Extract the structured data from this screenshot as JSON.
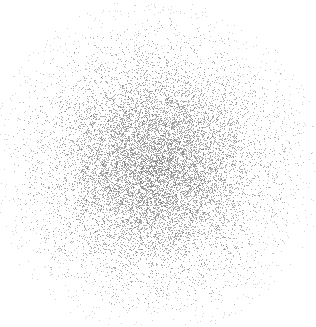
{
  "figure": {
    "width": 316,
    "height": 327,
    "background_color": "#ffffff",
    "title": "",
    "has_axes": false,
    "has_gridlines": false,
    "has_legend": false,
    "has_tick_labels": false,
    "has_frame": false
  },
  "chart_data": {
    "type": "scatter",
    "title": "",
    "xlabel": "",
    "ylabel": "",
    "grid": false,
    "legend_position": "none",
    "xlim": [
      0,
      316
    ],
    "ylim": [
      0,
      327
    ],
    "marker": {
      "shape": "square-pixel",
      "size_px": 1,
      "color": "#6e6e6e",
      "opacity": 0.55,
      "edge_color": "none"
    },
    "series": [
      {
        "name": "gaussian-cloud",
        "distribution": "bivariate-normal",
        "n_points": 12000,
        "center_x": 155,
        "center_y": 166,
        "sigma_x": 52,
        "sigma_y": 52,
        "correlation": 0.0,
        "max_radius_px": 148,
        "color": "#6e6e6e"
      }
    ],
    "density_profile": {
      "radii_px": [
        0,
        15,
        30,
        45,
        60,
        75,
        90,
        105,
        120,
        135,
        150
      ],
      "relative_density": [
        1.0,
        0.96,
        0.84,
        0.65,
        0.44,
        0.26,
        0.13,
        0.06,
        0.025,
        0.008,
        0.002
      ],
      "observed_gray_level": [
        "#777777",
        "#7a7a7a",
        "#828282",
        "#8f8f8f",
        "#a3a3a3",
        "#bdbdbd",
        "#d4d4d4",
        "#e6e6e6",
        "#f2f2f2",
        "#fafafa",
        "#fefefe"
      ]
    },
    "extent": {
      "left_px": 12,
      "right_px": 302,
      "top_px": 26,
      "bottom_px": 312,
      "core_left_px": 108,
      "core_right_px": 205,
      "core_top_px": 118,
      "core_bottom_px": 216
    }
  }
}
